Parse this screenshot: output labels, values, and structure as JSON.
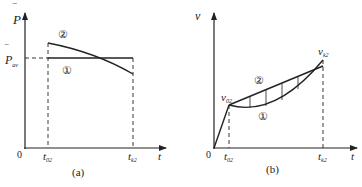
{
  "panels": [
    {
      "id": "a",
      "caption": "(a)",
      "y_axis_label": "P",
      "y_axis_bar": "‾",
      "x_axis_label": "t",
      "origin_label": "0",
      "level_label": "P",
      "level_label_sub": "av",
      "t_start_label": "t",
      "t_start_sub": "02",
      "t_end_label": "t",
      "t_end_sub": "k2",
      "curve_labels": {
        "flat": "①",
        "decreasing": "②"
      }
    },
    {
      "id": "b",
      "caption": "(b)",
      "y_axis_label": "v",
      "x_axis_label": "t",
      "origin_label": "0",
      "v_start_label": "v",
      "v_start_sub": "02",
      "v_end_label": "v",
      "v_end_sub": "k2",
      "t_start_label": "t",
      "t_start_sub": "02",
      "t_end_label": "t",
      "t_end_sub": "k2",
      "curve_labels": {
        "concave": "①",
        "linear": "②"
      }
    }
  ],
  "colors": {
    "line": "#222222",
    "background": "#ffffff"
  }
}
